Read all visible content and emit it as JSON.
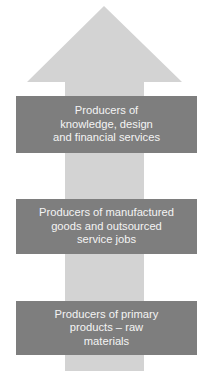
{
  "diagram": {
    "type": "upward-arrow-hierarchy",
    "colors": {
      "arrow": "#d3d3d3",
      "box": "#7e7e7e",
      "text": "#f4f4f4",
      "background": "#ffffff"
    },
    "levels": [
      {
        "id": "top",
        "label": "Producers of\nknowledge, design\nand financial services"
      },
      {
        "id": "middle",
        "label": "Producers of manufactured\ngoods and outsourced\nservice jobs"
      },
      {
        "id": "bottom",
        "label": "Producers of primary\nproducts – raw\nmaterials"
      }
    ]
  }
}
